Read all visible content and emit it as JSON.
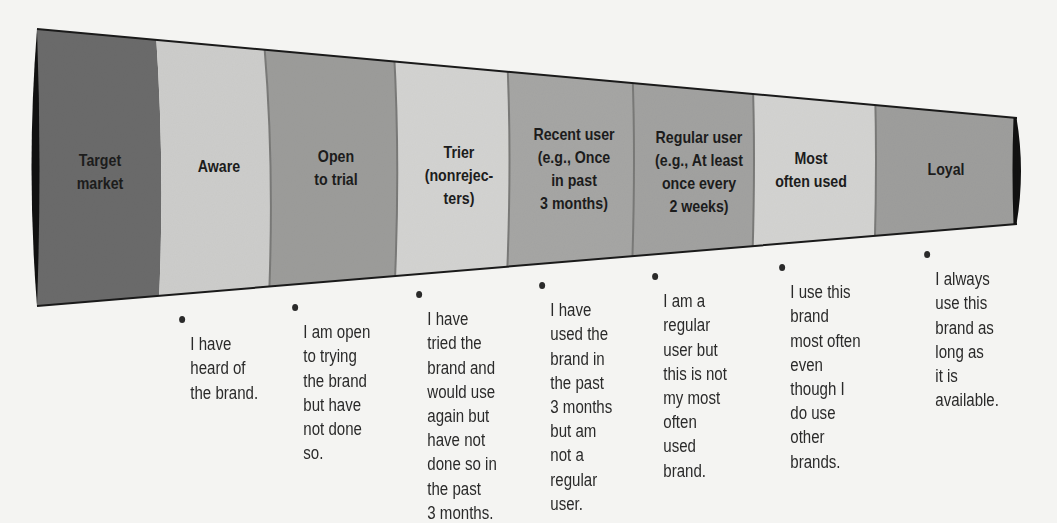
{
  "diagram": {
    "type": "purchase-funnel",
    "colors": {
      "background": "#f4f4f2",
      "outline": "#1a1a1a",
      "dark": "#6b6b6b",
      "light": "#cdcdcb",
      "mid": "#9c9c9a",
      "text": "#1c1c1c"
    },
    "stages": [
      {
        "label": "Target\nmarket",
        "description": ""
      },
      {
        "label": "Aware",
        "description": "I have\nheard of\nthe brand."
      },
      {
        "label": "Open\nto trial",
        "description": "I am open\nto trying\nthe brand\nbut have\nnot done\nso."
      },
      {
        "label": "Trier\n(nonrejec-\nters)",
        "description": "I have\ntried the\nbrand and\nwould use\nagain but\nhave not\ndone so in\nthe past\n3 months."
      },
      {
        "label": "Recent user\n(e.g., Once\nin past\n3 months)",
        "description": "I have\nused the\nbrand in\nthe past\n3 months\nbut am\nnot a\nregular\nuser."
      },
      {
        "label": "Regular user\n(e.g., At least\nonce every\n2 weeks)",
        "description": "I am a\nregular\nuser but\nthis is not\nmy most\noften\nused\nbrand."
      },
      {
        "label": "Most\noften used",
        "description": "I use this\nbrand\nmost often\neven\nthough I\ndo use\nother\nbrands."
      },
      {
        "label": "Loyal",
        "description": "I always\nuse this\nbrand as\nlong as\nit is\navailable."
      }
    ]
  }
}
